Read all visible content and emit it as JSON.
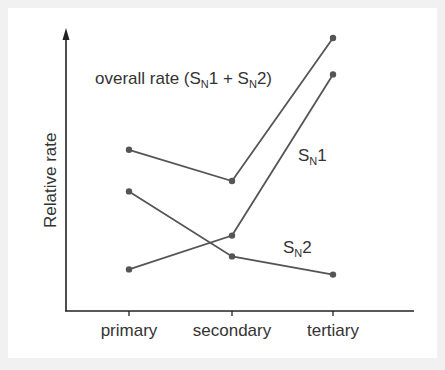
{
  "chart_data": {
    "type": "line",
    "title": "",
    "xlabel": "",
    "ylabel": "Relative rate",
    "categories": [
      "primary",
      "secondary",
      "tertiary"
    ],
    "series": [
      {
        "name": "overall rate (SN1 + SN2)",
        "label_main": "overall rate (S",
        "values": [
          6.2,
          5.0,
          10.5
        ]
      },
      {
        "name": "SN1",
        "values": [
          1.6,
          2.9,
          9.1
        ]
      },
      {
        "name": "SN2",
        "values": [
          4.6,
          2.1,
          1.4
        ]
      }
    ],
    "ylim": [
      0,
      11
    ],
    "grid": false,
    "legend": "inline labels",
    "axis_ticks_y": false,
    "line_color": "#555555",
    "marker_color": "#555555"
  },
  "labels": {
    "ylabel": "Relative rate",
    "x_ticks": [
      "primary",
      "secondary",
      "tertiary"
    ],
    "overall": {
      "pre": "overall rate (S",
      "sub1": "N",
      "mid": "1 + S",
      "sub2": "N",
      "post": "2)"
    },
    "sn1": {
      "s": "S",
      "sub": "N",
      "n": "1"
    },
    "sn2": {
      "s": "S",
      "sub": "N",
      "n": "2"
    }
  }
}
